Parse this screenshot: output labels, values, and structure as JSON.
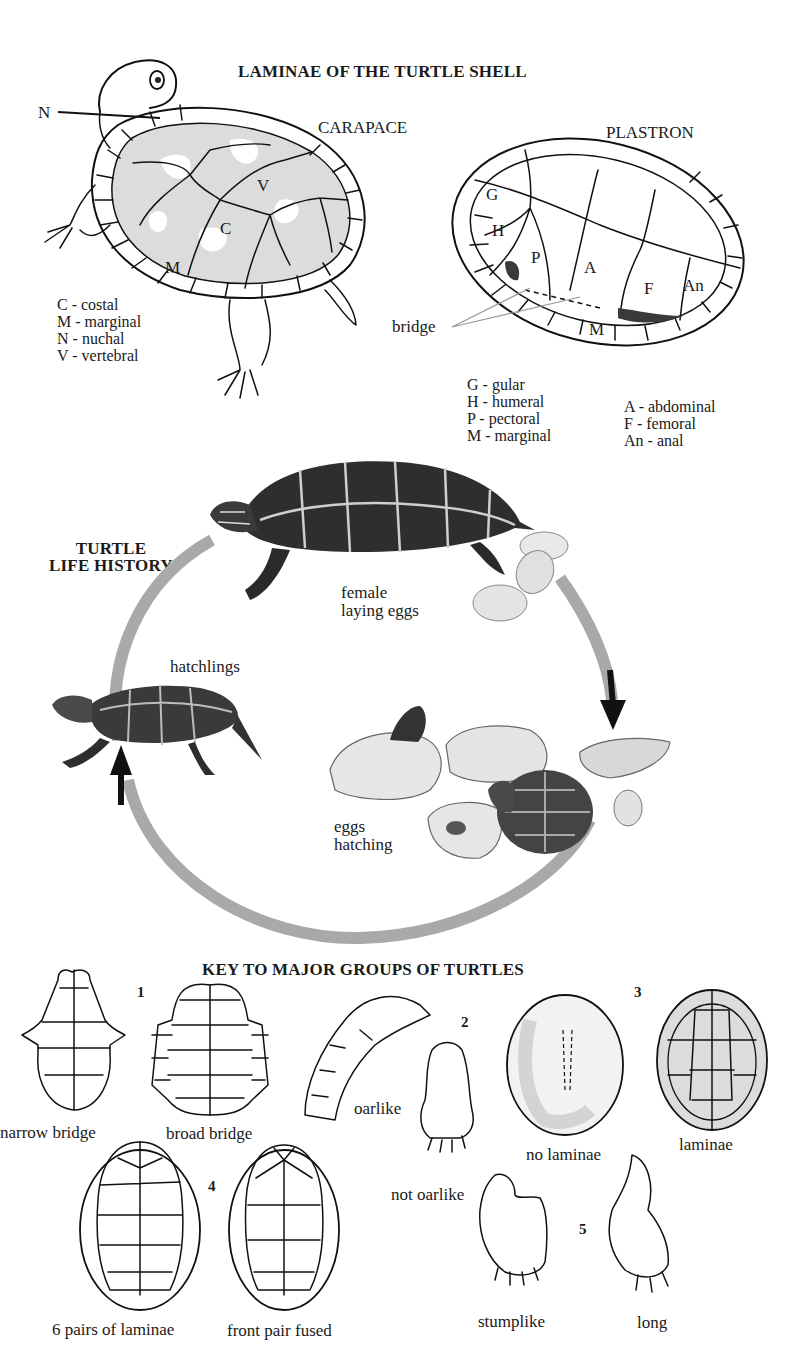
{
  "laminae_section": {
    "title": "LAMINAE OF THE TURTLE SHELL",
    "carapace": {
      "heading": "CARAPACE",
      "diagram_labels": {
        "nuchal": "N",
        "vertebral": "V",
        "costal": "C",
        "marginal": "M"
      },
      "legend": [
        "C - costal",
        "M - marginal",
        "N - nuchal",
        "V - vertebral"
      ]
    },
    "plastron": {
      "heading": "PLASTRON",
      "diagram_labels": {
        "gular": "G",
        "humeral": "H",
        "pectoral": "P",
        "abdominal": "A",
        "femoral": "F",
        "anal": "An",
        "marginal": "M"
      },
      "bridge_label": "bridge",
      "legend_left": [
        "G - gular",
        "H - humeral",
        "P - pectoral",
        "M - marginal"
      ],
      "legend_right": [
        "A - abdominal",
        "F - femoral",
        "An - anal"
      ]
    }
  },
  "life_history": {
    "title_line1": "TURTLE",
    "title_line2": "LIFE HISTORY",
    "stages": [
      {
        "id": "female",
        "line1": "female",
        "line2": "laying eggs"
      },
      {
        "id": "eggs",
        "line1": "eggs",
        "line2": "hatching"
      },
      {
        "id": "hatchlings",
        "line1": "hatchlings"
      }
    ],
    "cycle_color": "#a9a9a9",
    "arrow_color": "#111111"
  },
  "key_section": {
    "title": "KEY TO MAJOR GROUPS OF TURTLES",
    "groups": [
      {
        "number": "1",
        "options": [
          "narrow bridge",
          "broad bridge"
        ]
      },
      {
        "number": "2",
        "options": [
          "oarlike",
          "not oarlike"
        ]
      },
      {
        "number": "3",
        "options": [
          "no laminae",
          "laminae"
        ]
      },
      {
        "number": "4",
        "options": [
          "6 pairs of laminae",
          "front pair fused"
        ]
      },
      {
        "number": "5",
        "options": [
          "stumplike",
          "long"
        ]
      }
    ]
  }
}
